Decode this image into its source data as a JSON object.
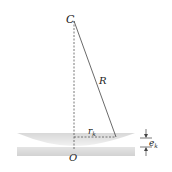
{
  "diagram": {
    "labels": {
      "center": "C",
      "radius": "R",
      "ring_radius": "r",
      "ring_radius_sub": "k",
      "origin": "O",
      "gap": "e",
      "gap_sub": "k"
    },
    "colors": {
      "line": "#333333",
      "lens_fill": "#e6e6e6",
      "plate_fill": "#dcdcdc",
      "text": "#222222"
    }
  }
}
